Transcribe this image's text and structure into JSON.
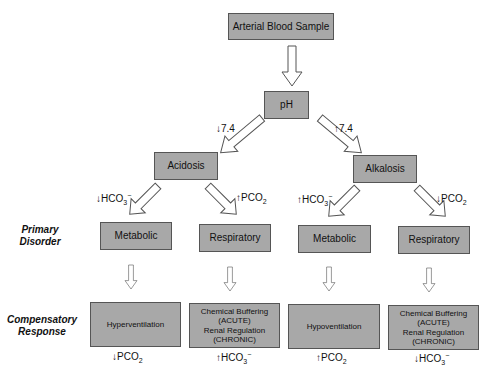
{
  "title": "Arterial Blood Sample",
  "level1": {
    "label": "pH"
  },
  "level2": {
    "left": {
      "label": "Acidosis",
      "edge_label": "↓7.4"
    },
    "right": {
      "label": "Alkalosis",
      "edge_label": "↑7.4"
    }
  },
  "primary_disorder_label": [
    "Primary",
    "Disorder"
  ],
  "compensatory_response_label": [
    "Compensatory",
    "Response"
  ],
  "columns": [
    {
      "edge_label_arrow": "↓",
      "edge_label_main": "HCO",
      "edge_label_sub": "3",
      "edge_label_sup": "−",
      "disorder": "Metabolic",
      "response_lines": [
        "Hyperventilation"
      ],
      "result_arrow": "↓",
      "result_main": "PCO",
      "result_sub": "2",
      "result_sup": ""
    },
    {
      "edge_label_arrow": "↑",
      "edge_label_main": "PCO",
      "edge_label_sub": "2",
      "edge_label_sup": "",
      "disorder": "Respiratory",
      "response_lines": [
        "Chemical Buffering",
        "(ACUTE)",
        "Renal Regulation",
        "(CHRONIC)"
      ],
      "result_arrow": "↑",
      "result_main": "HCO",
      "result_sub": "3",
      "result_sup": "−"
    },
    {
      "edge_label_arrow": "↑",
      "edge_label_main": "HCO",
      "edge_label_sub": "3",
      "edge_label_sup": "−",
      "disorder": "Metabolic",
      "response_lines": [
        "Hypoventilation"
      ],
      "result_arrow": "↑",
      "result_main": "PCO",
      "result_sub": "2",
      "result_sup": ""
    },
    {
      "edge_label_arrow": "↓",
      "edge_label_main": "PCO",
      "edge_label_sub": "2",
      "edge_label_sup": "",
      "disorder": "Respiratory",
      "response_lines": [
        "Chemical Buffering",
        "(ACUTE)",
        "Renal Regulation",
        "(CHRONIC)"
      ],
      "result_arrow": "↓",
      "result_main": "HCO",
      "result_sub": "3",
      "result_sup": "−"
    }
  ],
  "colors": {
    "box_fill": "#a8a8a8",
    "box_border": "#555555",
    "arrow_stroke": "#555555"
  }
}
